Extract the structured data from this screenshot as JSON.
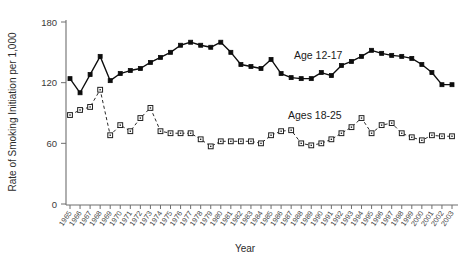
{
  "chart_data": {
    "type": "line",
    "title": "",
    "xlabel": "Year",
    "ylabel": "Rate of Smoking Initiation per 1,000",
    "ylim": [
      0,
      180
    ],
    "yticks": [
      0,
      60,
      120,
      180
    ],
    "ytick_labels": [
      "0",
      "60",
      "120",
      "180"
    ],
    "grid": false,
    "legend_position": "inline-annotations",
    "x": [
      1965,
      1966,
      1967,
      1968,
      1969,
      1970,
      1971,
      1972,
      1973,
      1974,
      1975,
      1976,
      1977,
      1978,
      1979,
      1980,
      1981,
      1982,
      1983,
      1984,
      1985,
      1986,
      1987,
      1988,
      1989,
      1990,
      1991,
      1992,
      1993,
      1994,
      1995,
      1996,
      1997,
      1998,
      1999,
      2000,
      2001,
      2002,
      2003
    ],
    "xtick_labels": [
      "1965",
      "1966",
      "1967",
      "1968",
      "1969",
      "1970",
      "1971",
      "1972",
      "1973",
      "1974",
      "1975",
      "1976",
      "1977",
      "1978",
      "1979",
      "1980",
      "1981",
      "1982",
      "1983",
      "1984",
      "1985",
      "1986",
      "1987",
      "1988",
      "1989",
      "1990",
      "1991",
      "1992",
      "1993",
      "1994",
      "1995",
      "1996",
      "1997",
      "1998",
      "1999",
      "2000",
      "2001",
      "2002",
      "2003"
    ],
    "series": [
      {
        "name": "Age 12-17",
        "label": "Age 12-17",
        "marker": "filled-square",
        "linestyle": "solid",
        "color": "#0d0d0d",
        "values": [
          124,
          110,
          128,
          146,
          122,
          129,
          132,
          134,
          140,
          145,
          150,
          157,
          160,
          157,
          155,
          160,
          150,
          138,
          136,
          134,
          143,
          129,
          125,
          124,
          124,
          130,
          127,
          137,
          141,
          146,
          152,
          149,
          147,
          146,
          144,
          138,
          130,
          118,
          118
        ]
      },
      {
        "name": "Ages 18-25",
        "label": "Ages 18-25",
        "marker": "open-square",
        "linestyle": "dashed",
        "color": "#2a2a2a",
        "values": [
          88,
          93,
          96,
          113,
          68,
          78,
          72,
          85,
          95,
          72,
          70,
          70,
          70,
          64,
          57,
          62,
          62,
          62,
          62,
          60,
          68,
          72,
          73,
          60,
          58,
          60,
          64,
          70,
          76,
          85,
          70,
          78,
          80,
          70,
          66,
          63,
          68,
          67,
          67
        ]
      }
    ],
    "annotations": [
      {
        "text": "Age 12-17",
        "x_px": 294,
        "y_px": 59
      },
      {
        "text": "Ages 18-25",
        "x_px": 288,
        "y_px": 119
      }
    ]
  },
  "axes": {
    "y_axis_title": "Rate of Smoking Initiation per 1,000",
    "x_axis_title": "Year"
  }
}
